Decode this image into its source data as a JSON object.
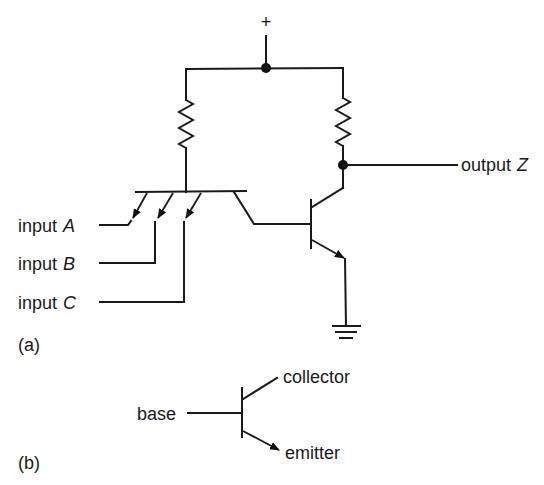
{
  "figure": {
    "type": "circuit-schematic"
  },
  "panel_a": {
    "label": "(a)",
    "supply": {
      "symbol": "+"
    },
    "inputs": [
      {
        "prefix": "input",
        "name": "A"
      },
      {
        "prefix": "input",
        "name": "B"
      },
      {
        "prefix": "input",
        "name": "C"
      }
    ],
    "output": {
      "prefix": "output",
      "name": "Z"
    },
    "components": [
      "resistor-left",
      "resistor-right",
      "multi-emitter-transistor",
      "output-transistor",
      "ground"
    ]
  },
  "panel_b": {
    "label": "(b)",
    "terminals": {
      "base": "base",
      "collector": "collector",
      "emitter": "emitter"
    }
  },
  "colors": {
    "ink": "#1a1a1a",
    "background": "#ffffff"
  }
}
